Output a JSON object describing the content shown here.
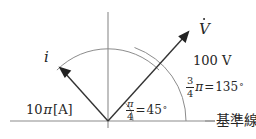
{
  "figure": {
    "type": "phasor-diagram",
    "width": 256,
    "height": 139,
    "background_color": "#ffffff",
    "line_color": "#8c8c8c",
    "vector_color": "#333333",
    "text_color": "#262626"
  },
  "axes": {
    "baseline_label": "基準線",
    "origin": {
      "x": 108,
      "y": 121
    },
    "horizontal": {
      "x1": 10,
      "y1": 121,
      "x2": 215,
      "y2": 121
    },
    "vertical": {
      "x1": 108,
      "y1": 12,
      "x2": 108,
      "y2": 128
    }
  },
  "phasors": [
    {
      "name": "voltage",
      "symbol": "V",
      "symbol_has_dot": true,
      "magnitude_label": "100 V",
      "angle_deg": 45,
      "angle_label_fraction_numerator": "3",
      "angle_label_fraction_denominator": "4",
      "angle_label_pi": "π",
      "angle_label_equals": "=",
      "angle_label_value": "135",
      "angle_label_degree": "°",
      "tip": {
        "x": 188,
        "y": 33
      }
    },
    {
      "name": "current",
      "symbol": "i",
      "symbol_has_dot": false,
      "magnitude_label": "10π[A]",
      "angle_deg": 135,
      "tip": {
        "x": 60,
        "y": 68
      }
    }
  ],
  "angle_marks": [
    {
      "name": "angle-45",
      "radius": 25,
      "from_deg": 0,
      "to_deg": 45,
      "fraction_numerator": "π",
      "fraction_denominator": "4",
      "equals": "=",
      "value": "45",
      "degree": "°"
    },
    {
      "name": "angle-135",
      "radius": 78,
      "from_deg": 0,
      "to_deg": 100
    }
  ],
  "arcs": [
    {
      "name": "phasor-span-arc",
      "radius": 72,
      "from_deg": 45,
      "to_deg": 135
    }
  ],
  "labels": {
    "voltage_symbol": "V",
    "voltage_magnitude": "100 V",
    "current_symbol": "i",
    "current_magnitude_prefix": "10",
    "current_magnitude_pi": "π",
    "current_magnitude_unit": "[A]",
    "baseline": "基準線",
    "angle45_pi": "π",
    "angle45_den": "4",
    "angle45_eq": "=",
    "angle45_val": "45",
    "angle45_deg": "°",
    "angle135_num": "3",
    "angle135_den": "4",
    "angle135_pi": "π",
    "angle135_eq": "=",
    "angle135_val": "135",
    "angle135_deg": "°"
  }
}
